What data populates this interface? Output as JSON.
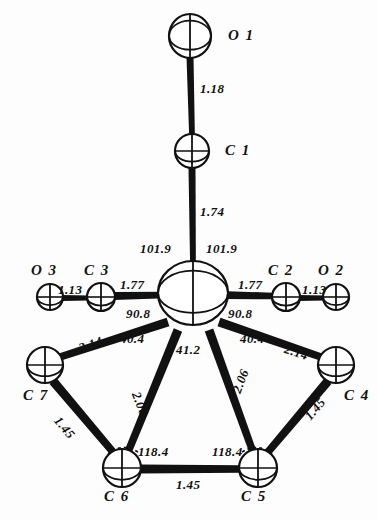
{
  "figure": {
    "background_color": "#fdfdfd",
    "ink_color": "#111111",
    "width": 378,
    "height": 520
  },
  "atoms": [
    {
      "id": "O1",
      "label": "O 1",
      "cx": 190,
      "cy": 36,
      "rx": 21,
      "ry": 22,
      "label_x": 228,
      "label_y": 28
    },
    {
      "id": "C1",
      "label": "C 1",
      "cx": 192,
      "cy": 151,
      "rx": 17,
      "ry": 17,
      "label_x": 225,
      "label_y": 143
    },
    {
      "id": "M",
      "label": "",
      "cx": 193,
      "cy": 293,
      "rx": 35,
      "ry": 32,
      "label_x": 0,
      "label_y": 0
    },
    {
      "id": "O3",
      "label": "O 3",
      "cx": 50,
      "cy": 297,
      "rx": 13,
      "ry": 13,
      "label_x": 31,
      "label_y": 263
    },
    {
      "id": "C3",
      "label": "C 3",
      "cx": 101,
      "cy": 297,
      "rx": 14,
      "ry": 14,
      "label_x": 84,
      "label_y": 263
    },
    {
      "id": "C2",
      "label": "C 2",
      "cx": 286,
      "cy": 297,
      "rx": 14,
      "ry": 14,
      "label_x": 268,
      "label_y": 263
    },
    {
      "id": "O2",
      "label": "O 2",
      "cx": 336,
      "cy": 297,
      "rx": 13,
      "ry": 13,
      "label_x": 318,
      "label_y": 263
    },
    {
      "id": "C7",
      "label": "C 7",
      "cx": 45,
      "cy": 365,
      "rx": 18,
      "ry": 18,
      "label_x": 23,
      "label_y": 388
    },
    {
      "id": "C4",
      "label": "C 4",
      "cx": 336,
      "cy": 365,
      "rx": 18,
      "ry": 18,
      "label_x": 344,
      "label_y": 388
    },
    {
      "id": "C6",
      "label": "C 6",
      "cx": 122,
      "cy": 468,
      "rx": 19,
      "ry": 19,
      "label_x": 104,
      "label_y": 489
    },
    {
      "id": "C5",
      "label": "C 5",
      "cx": 258,
      "cy": 468,
      "rx": 19,
      "ry": 19,
      "label_x": 241,
      "label_y": 489
    }
  ],
  "bonds": [
    {
      "from": "O1",
      "to": "C1",
      "x1": 190,
      "y1": 57,
      "x2": 192,
      "y2": 135,
      "width": 7
    },
    {
      "from": "C1",
      "to": "M",
      "x1": 192,
      "y1": 168,
      "x2": 193,
      "y2": 266,
      "width": 7
    },
    {
      "from": "O3",
      "to": "C3",
      "x1": 62,
      "y1": 298,
      "x2": 89,
      "y2": 298,
      "width": 6
    },
    {
      "from": "C3",
      "to": "M",
      "x1": 114,
      "y1": 296,
      "x2": 166,
      "y2": 295,
      "width": 8
    },
    {
      "from": "M",
      "to": "C2",
      "x1": 221,
      "y1": 295,
      "x2": 273,
      "y2": 296,
      "width": 8
    },
    {
      "from": "C2",
      "to": "O2",
      "x1": 298,
      "y1": 298,
      "x2": 325,
      "y2": 298,
      "width": 6
    },
    {
      "from": "M",
      "to": "C7",
      "x1": 168,
      "y1": 322,
      "x2": 60,
      "y2": 357,
      "width": 9
    },
    {
      "from": "M",
      "to": "C4",
      "x1": 219,
      "y1": 322,
      "x2": 321,
      "y2": 357,
      "width": 9
    },
    {
      "from": "M",
      "to": "C6",
      "x1": 178,
      "y1": 330,
      "x2": 128,
      "y2": 452,
      "width": 9
    },
    {
      "from": "M",
      "to": "C5",
      "x1": 209,
      "y1": 330,
      "x2": 253,
      "y2": 452,
      "width": 9
    },
    {
      "from": "C7",
      "to": "C6",
      "x1": 53,
      "y1": 381,
      "x2": 113,
      "y2": 452,
      "width": 9
    },
    {
      "from": "C4",
      "to": "C5",
      "x1": 328,
      "y1": 381,
      "x2": 268,
      "y2": 452,
      "width": 9
    },
    {
      "from": "C6",
      "to": "C5",
      "x1": 140,
      "y1": 469,
      "x2": 240,
      "y2": 469,
      "width": 9
    }
  ],
  "bond_labels": [
    {
      "id": "O1-C1",
      "text": "1.18",
      "x": 200,
      "y": 82,
      "rotate": 0
    },
    {
      "id": "C1-M",
      "text": "1.74",
      "x": 200,
      "y": 205,
      "rotate": 0
    },
    {
      "id": "O3-C3",
      "text": "1.13",
      "x": 58,
      "y": 283,
      "rotate": 0
    },
    {
      "id": "C3-M",
      "text": "1.77",
      "x": 120,
      "y": 278,
      "rotate": 0
    },
    {
      "id": "M-C2",
      "text": "1.77",
      "x": 238,
      "y": 278,
      "rotate": 0
    },
    {
      "id": "C2-O2",
      "text": "1.13",
      "x": 302,
      "y": 283,
      "rotate": 0
    },
    {
      "id": "M-C7",
      "text": "2.14",
      "x": 77,
      "y": 342,
      "rotate": -19
    },
    {
      "id": "M-C4",
      "text": "2.14",
      "x": 287,
      "y": 342,
      "rotate": 19
    },
    {
      "id": "M-C6",
      "text": "2.06",
      "x": 142,
      "y": 390,
      "rotate": 69
    },
    {
      "id": "M-C5",
      "text": "2.06",
      "x": 230,
      "y": 390,
      "rotate": -69
    },
    {
      "id": "C7-C6",
      "text": "1.45",
      "x": 62,
      "y": 414,
      "rotate": 50
    },
    {
      "id": "C4-C5",
      "text": "1.45",
      "x": 302,
      "y": 414,
      "rotate": -50
    },
    {
      "id": "C6-C5",
      "text": "1.45",
      "x": 176,
      "y": 478,
      "rotate": 0
    }
  ],
  "angle_labels": [
    {
      "id": "C1-M-C3",
      "text": "101.9",
      "x": 140,
      "y": 242
    },
    {
      "id": "C1-M-C2",
      "text": "101.9",
      "x": 206,
      "y": 242
    },
    {
      "id": "C3-M-ring-left",
      "text": "90.8",
      "x": 126,
      "y": 307
    },
    {
      "id": "C2-M-ring-right",
      "text": "90.8",
      "x": 228,
      "y": 307
    },
    {
      "id": "ring-left-40",
      "text": "40.4",
      "x": 120,
      "y": 332
    },
    {
      "id": "ring-right-40",
      "text": "40.4",
      "x": 240,
      "y": 332
    },
    {
      "id": "ring-center-41",
      "text": "41.2",
      "x": 176,
      "y": 343
    },
    {
      "id": "C7-C6-C5",
      "text": "118.4",
      "x": 138,
      "y": 445
    },
    {
      "id": "C4-C5-C6",
      "text": "118.4",
      "x": 212,
      "y": 445
    }
  ]
}
